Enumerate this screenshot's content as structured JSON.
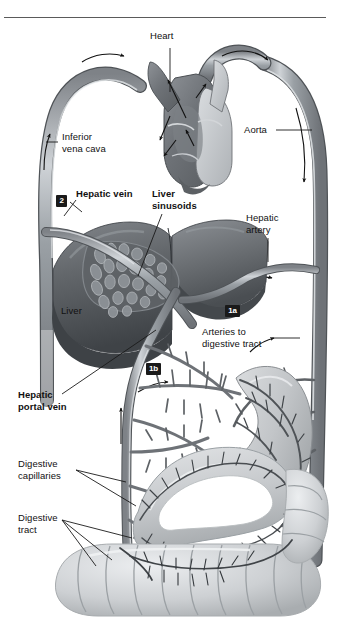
{
  "figure": {
    "width": 339,
    "height": 639,
    "background": "#ffffff",
    "rule_color": "#5a5a5a"
  },
  "colors": {
    "vessel_mid": "#8d9196",
    "vessel_dark": "#6a6e73",
    "vessel_light": "#c9cdd1",
    "vessel_outline": "#4d5155",
    "liver_dark": "#55585c",
    "liver_mid": "#74787c",
    "liver_light": "#9aa0a4",
    "heart_dark": "#6d7277",
    "heart_light": "#c3c7cb",
    "gut_light": "#d4d7da",
    "gut_mid": "#b7bbbe",
    "badge_bg": "#1a1a1a",
    "badge_fg": "#ffffff",
    "text": "#111111"
  },
  "labels": [
    {
      "id": "heart",
      "text": "Heart",
      "bold": false,
      "x": 150,
      "y": 36,
      "align": "left"
    },
    {
      "id": "aorta",
      "text": "Aorta",
      "bold": false,
      "x": 244,
      "y": 125,
      "align": "left"
    },
    {
      "id": "inferior-vena-cava",
      "text": "Inferior\nvena cava",
      "bold": false,
      "x": 62,
      "y": 137,
      "align": "left"
    },
    {
      "id": "hepatic-vein",
      "text": "Hepatic vein",
      "bold": true,
      "x": 76,
      "y": 191,
      "align": "left"
    },
    {
      "id": "liver-sinusoids",
      "text": "Liver\nsinusoids",
      "bold": true,
      "x": 152,
      "y": 191,
      "align": "left"
    },
    {
      "id": "hepatic-artery",
      "text": "Hepatic\nartery",
      "bold": false,
      "x": 246,
      "y": 214,
      "align": "left"
    },
    {
      "id": "liver",
      "text": "Liver",
      "bold": false,
      "x": 61,
      "y": 310,
      "align": "left"
    },
    {
      "id": "arteries-to-digestive-tract",
      "text": "Arteries to\ndigestive tract",
      "bold": false,
      "x": 202,
      "y": 332,
      "align": "left"
    },
    {
      "id": "hepatic-portal-vein",
      "text": "Hepatic\nportal vein",
      "bold": true,
      "x": 18,
      "y": 398,
      "align": "left"
    },
    {
      "id": "digestive-capillaries",
      "text": "Digestive\ncapillaries",
      "bold": false,
      "x": 18,
      "y": 461,
      "align": "left"
    },
    {
      "id": "digestive-tract",
      "text": "Digestive\ntract",
      "bold": false,
      "x": 18,
      "y": 515,
      "align": "left"
    }
  ],
  "badges": [
    {
      "id": "step-2",
      "text": "2",
      "x": 56,
      "y": 195
    },
    {
      "id": "step-1a",
      "text": "1a",
      "x": 225,
      "y": 305
    },
    {
      "id": "step-1b",
      "text": "1b",
      "x": 146,
      "y": 363
    }
  ],
  "anatomy": {
    "structures": [
      "heart",
      "aorta",
      "inferior vena cava",
      "hepatic vein",
      "liver",
      "liver sinusoids",
      "hepatic artery",
      "hepatic portal vein",
      "arteries to digestive tract",
      "digestive capillaries",
      "digestive tract"
    ]
  }
}
